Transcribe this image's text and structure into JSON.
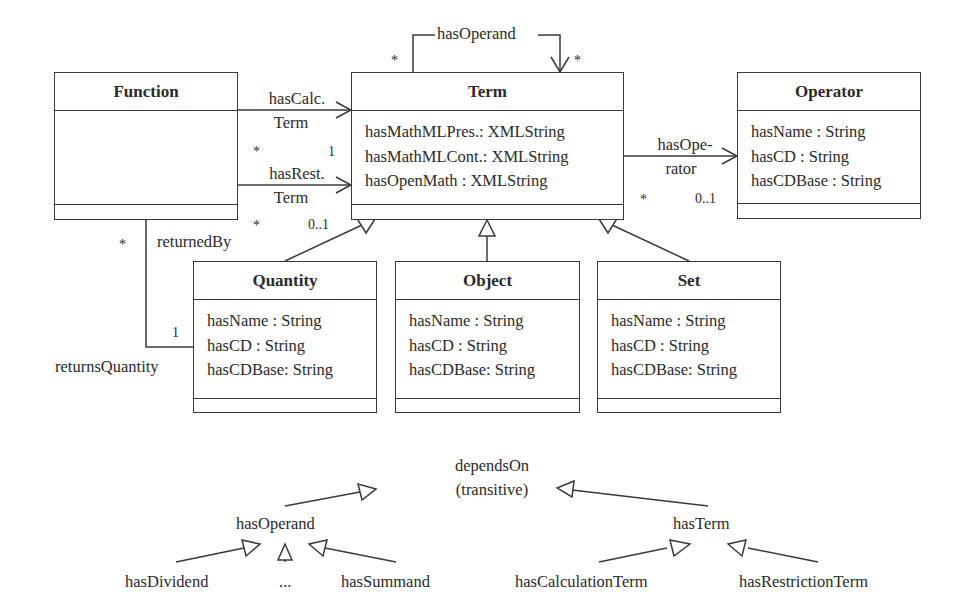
{
  "classes": {
    "function": {
      "name": "Function",
      "attributes": []
    },
    "term": {
      "name": "Term",
      "attributes": [
        "hasMathMLPres.: XMLString",
        "hasMathMLCont.: XMLString",
        "hasOpenMath : XMLString"
      ]
    },
    "operator": {
      "name": "Operator",
      "attributes": [
        "hasName : String",
        "hasCD : String",
        "hasCDBase : String"
      ]
    },
    "quantity": {
      "name": "Quantity",
      "attributes": [
        "hasName : String",
        "hasCD : String",
        "hasCDBase: String"
      ]
    },
    "object": {
      "name": "Object",
      "attributes": [
        "hasName : String",
        "hasCD : String",
        "hasCDBase: String"
      ]
    },
    "set": {
      "name": "Set",
      "attributes": [
        "hasName : String",
        "hasCD : String",
        "hasCDBase: String"
      ]
    }
  },
  "associations": {
    "has_operand_self": {
      "label": "hasOperand",
      "mult_source": "*",
      "mult_target": "*"
    },
    "has_calc_term": {
      "label_line1": "hasCalc.",
      "label_line2": "Term",
      "mult_source": "*",
      "mult_target": "1"
    },
    "has_rest_term": {
      "label_line1": "hasRest.",
      "label_line2": "Term",
      "mult_source": "*",
      "mult_target": "0..1"
    },
    "has_operator": {
      "label_line1": "hasOpe-",
      "label_line2": "rator",
      "mult_source": "*",
      "mult_target": "0..1"
    },
    "returned_by": {
      "label": "returnedBy",
      "mult": "*"
    },
    "returns_quantity": {
      "label": "returnsQuantity",
      "mult": "1"
    }
  },
  "property_hierarchy": {
    "root_line1": "dependsOn",
    "root_line2": "(transitive)",
    "has_operand": "hasOperand",
    "has_term": "hasTerm",
    "has_dividend": "hasDividend",
    "ellipsis": "...",
    "has_summand": "hasSummand",
    "has_calculation_term": "hasCalculationTerm",
    "has_restriction_term": "hasRestrictionTerm"
  }
}
